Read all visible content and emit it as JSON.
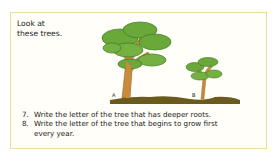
{
  "intro": {
    "line1": "Look at",
    "line2": "these trees."
  },
  "illustration": {
    "tree_a_label": "A",
    "tree_b_label": "B",
    "colors": {
      "foliage": "#6aa83a",
      "foliage_dark": "#3f7a22",
      "trunk": "#c98a3c",
      "ground": "#6b5a1e"
    }
  },
  "questions": [
    {
      "number": "7.",
      "text": "Write the letter of the tree that has deeper roots."
    },
    {
      "number": "8.",
      "text": "Write the letter of the tree that begins to grow first",
      "continuation": "every year."
    }
  ],
  "colors": {
    "border": "#eedc9c"
  }
}
